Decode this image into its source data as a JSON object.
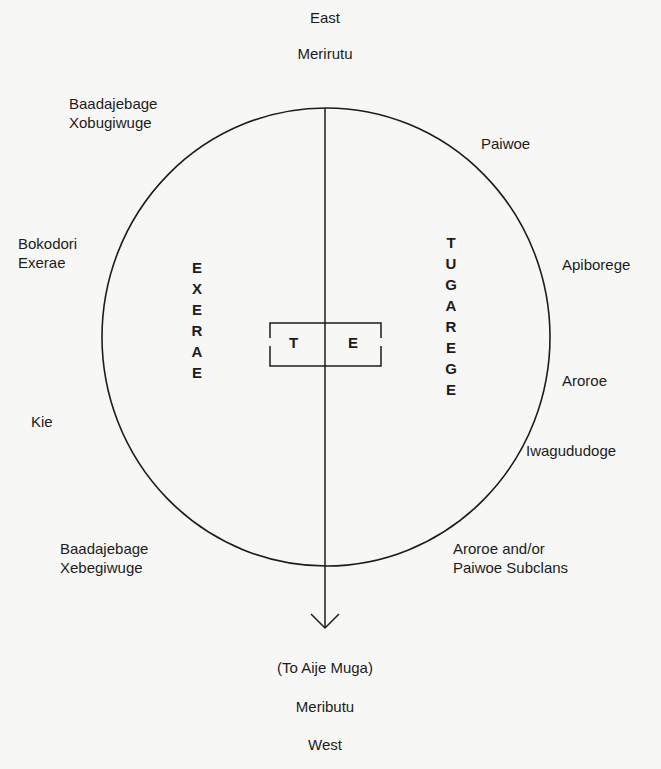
{
  "compass": {
    "top": "East",
    "top_name": "Merirutu",
    "bottom_note": "(To Aije Muga)",
    "bottom_name": "Meributu",
    "bottom": "West"
  },
  "halves": {
    "left": "EXERAE",
    "right": "TUGAREGE"
  },
  "center_box": {
    "left": "T",
    "right": "E"
  },
  "clans_left": {
    "upper_1": "Baadajebage",
    "upper_2": "Xobugiwuge",
    "mid_1": "Bokodori",
    "mid_2": "Exerae",
    "kie": "Kie",
    "lower_1": "Baadajebage",
    "lower_2": "Xebegiwuge"
  },
  "clans_right": {
    "paiwoe": "Paiwoe",
    "apiborege": "Apiborege",
    "aroroe": "Aroroe",
    "iwagududoge": "Iwagududoge",
    "subclans_1": "Aroroe and/or",
    "subclans_2": "Paiwoe Subclans"
  },
  "colors": {
    "ink": "#1c1c1c",
    "paper": "#f7f7f5"
  }
}
